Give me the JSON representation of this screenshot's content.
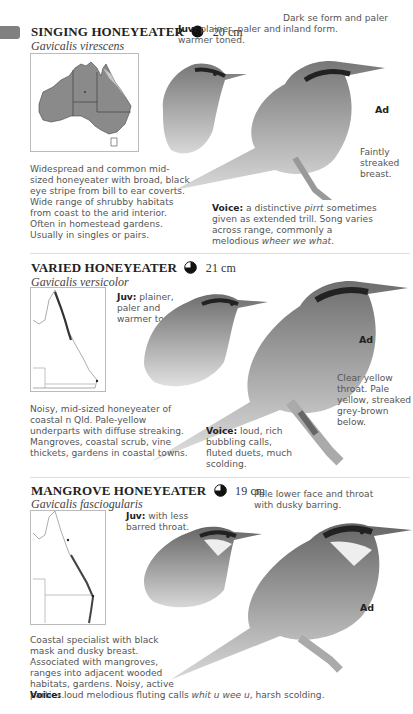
{
  "page_tab": {
    "color": "#808080"
  },
  "species": [
    {
      "common_name": "SINGING HONEYEATER",
      "status_icon": "filled-circle",
      "size": "20 cm",
      "scientific_name": "Gavicalis virescens",
      "juv_label": "Juv:",
      "juv_text": "plainer, paler and warmer toned.",
      "form_note": "Dark se form and paler inland form.",
      "ad_label": "Ad",
      "breast_note": "Faintly streaked breast.",
      "description": "Widespread and common mid-sized honeyeater with broad, black eye stripe from bill to ear coverts. Wide range of shrubby habitats from coast to the arid interior. Often in homestead gardens. Usually in singles or pairs.",
      "voice_label": "Voice:",
      "voice_pre": "a distinctive ",
      "voice_call": "pirrt",
      "voice_mid": " sometimes given as extended trill. Song varies across range, commonly a melodious ",
      "voice_song": "wheer we what",
      "voice_end": "."
    },
    {
      "common_name": "VARIED HONEYEATER",
      "status_icon": "three-quarter-circle",
      "size": "21 cm",
      "scientific_name": "Gavicalis versicolor",
      "juv_label": "Juv:",
      "juv_text": "plainer, paler and warmer toned.",
      "ad_label": "Ad",
      "throat_note": "Clear yellow throat. Pale yellow, streaked grey-brown below.",
      "description": "Noisy, mid-sized honeyeater of coastal n Qld. Pale-yellow underparts with diffuse streaking. Mangroves, coastal scrub, vine thickets, gardens in coastal towns.",
      "voice_label": "Voice:",
      "voice_text": "loud, rich bubbling calls, fluted duets, much scolding."
    },
    {
      "common_name": "MANGROVE HONEYEATER",
      "status_icon": "three-quarter-circle",
      "size": "19 cm",
      "scientific_name": "Gavicalis fasciogularis",
      "juv_label": "Juv:",
      "juv_text": "with less barred throat.",
      "face_note": "Pale lower face and throat with dusky barring.",
      "ad_label": "Ad",
      "description": "Coastal specialist with black mask and dusky breast. Associated with mangroves, ranges into adjacent wooded habitats, gardens. Noisy, active parties.",
      "voice_label": "Voice:",
      "voice_pre": "loud melodious fluting calls ",
      "voice_call": "whit u wee u",
      "voice_end": ", harsh scolding."
    }
  ]
}
